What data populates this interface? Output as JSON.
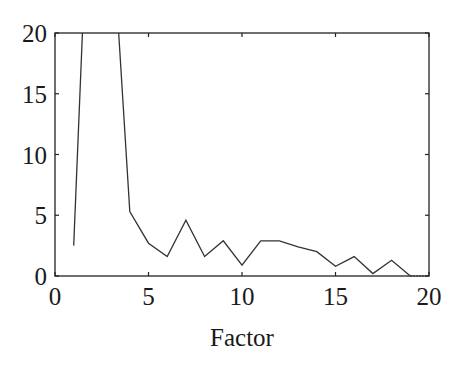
{
  "chart_data": {
    "type": "line",
    "title": "",
    "xlabel": "Factor",
    "ylabel": "",
    "xlim": [
      0,
      20
    ],
    "ylim": [
      0,
      20
    ],
    "xticks": [
      0,
      5,
      10,
      15,
      20
    ],
    "yticks": [
      0,
      5,
      10,
      15,
      20
    ],
    "grid": false,
    "legend": null,
    "series": [
      {
        "name": "series-1",
        "x": [
          1,
          2,
          3,
          4,
          5,
          6,
          7,
          8,
          9,
          10,
          11,
          12,
          13,
          14,
          15,
          16,
          17,
          18,
          19
        ],
        "y": [
          2.5,
          40,
          30,
          5.3,
          2.7,
          1.6,
          4.6,
          1.6,
          2.9,
          0.9,
          2.9,
          2.9,
          2.4,
          2.0,
          0.8,
          1.6,
          0.2,
          1.3,
          0
        ],
        "note": "values at factors 2 and 3 exceed the axis range (clipped at 20)"
      },
      {
        "name": "series-1-dotted-extension",
        "x": [
          19,
          20
        ],
        "y": [
          0,
          0
        ]
      }
    ],
    "colors": {
      "line": "#333333",
      "axes": "#222222",
      "background": "#ffffff"
    }
  }
}
